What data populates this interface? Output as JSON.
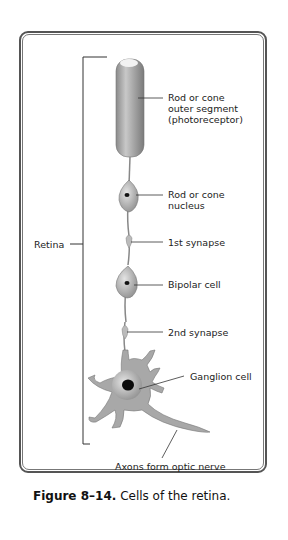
{
  "figure": {
    "number": "Figure 8–14.",
    "title": "Cells of the retina."
  },
  "bracket_label": "Retina",
  "labels": {
    "outer_segment": [
      "Rod or cone",
      "outer segment",
      "(photoreceptor)"
    ],
    "nucleus": [
      "Rod or cone",
      "nucleus"
    ],
    "synapse1": "1st synapse",
    "bipolar": "Bipolar cell",
    "synapse2": "2nd synapse",
    "ganglion": "Ganglion cell",
    "axons": "Axons form optic nerve"
  },
  "colors": {
    "frame": "#555555",
    "cell": "#b5b5b5",
    "nucleus": "#111111",
    "text": "#222222"
  }
}
